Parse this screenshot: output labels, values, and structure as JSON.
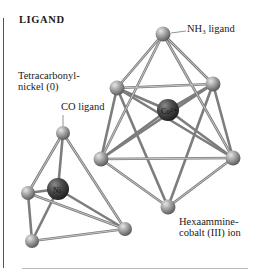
{
  "heading": "LIGAND",
  "labels": {
    "tetracarbonyl_line1": "Tetracarbonyl-",
    "tetracarbonyl_line2": "nickel (0)",
    "co_ligand": "CO ligand",
    "nh3_ligand": "NH₃ ligand",
    "hexaammine_line1": "Hexaammine-",
    "hexaammine_line2": "cobalt (III) ion"
  },
  "atoms": {
    "ni_center": "Ni",
    "co_center": "Co³⁺"
  },
  "colors": {
    "ligand_sphere": "#9a9a9a",
    "metal_sphere": "#4a4a4a",
    "bond": "#8a8a8a",
    "text": "#1a1a1a"
  }
}
